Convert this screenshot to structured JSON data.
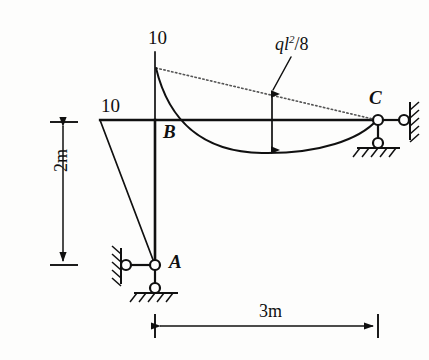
{
  "figure": {
    "kind": "structural-bending-moment-diagram"
  },
  "labels": {
    "moment_top": "10",
    "moment_left": "10",
    "joint_b": "B",
    "joint_a": "A",
    "joint_c": "C",
    "load_moment_numerator": "ql",
    "load_moment_exponent": "2",
    "load_moment_denominator": "/8",
    "dim_height": "2m",
    "dim_span": "3m"
  },
  "geometry": {
    "joint_a": {
      "x": 155,
      "y": 265
    },
    "joint_b": {
      "x": 155,
      "y": 120
    },
    "joint_c": {
      "x": 378,
      "y": 120
    },
    "beam_left_end_x": 100,
    "moment_ordinate_top_y": 52,
    "curve_start_y": 68,
    "curve_sag_y": 152,
    "dim_v_x": 63,
    "dim_v_top_y": 122,
    "dim_v_bottom_y": 265,
    "dim_h_y": 326,
    "dim_h_left_x": 155,
    "dim_h_right_x": 378,
    "arrow_x": 272,
    "arrow_top_y": 94,
    "arrow_bottom_y": 150,
    "leader_from": {
      "x": 290,
      "y": 58
    },
    "leader_to": {
      "x": 272,
      "y": 92
    }
  },
  "colors": {
    "ink": "#101010",
    "line": "#1a1a1a",
    "dotted": "#555555",
    "background": "#fdfdfc"
  }
}
